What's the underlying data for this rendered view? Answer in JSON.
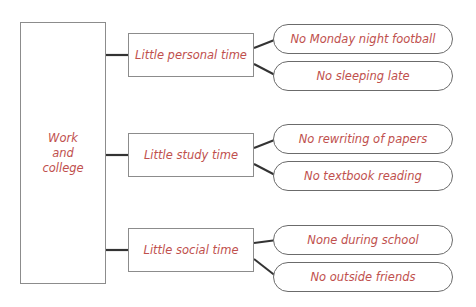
{
  "diagram": {
    "title_text": "Work\nand\ncollege",
    "text_color": "#c0504d",
    "box_border_color": "#8c8c8c",
    "pill_border_color": "#6b6b6b",
    "connector_color": "#333333",
    "background_color": "#ffffff",
    "root": {
      "label": "Work\nand\ncollege"
    },
    "branches": [
      {
        "label": "Little personal time",
        "leaves": [
          {
            "label": "No Monday night football"
          },
          {
            "label": "No sleeping late"
          }
        ]
      },
      {
        "label": "Little study time",
        "leaves": [
          {
            "label": "No rewriting of papers"
          },
          {
            "label": "No textbook reading"
          }
        ]
      },
      {
        "label": "Little social time",
        "leaves": [
          {
            "label": "None during school"
          },
          {
            "label": "No outside friends"
          }
        ]
      }
    ]
  }
}
